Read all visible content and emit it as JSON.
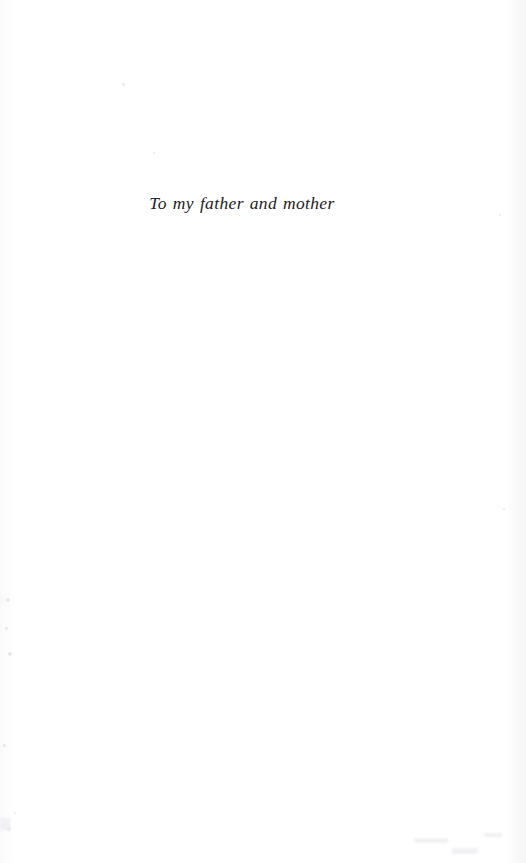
{
  "page": {
    "type": "book-dedication-page",
    "width": 526,
    "height": 863,
    "background_color": "#ffffff",
    "ink_color": "#1c1a1a",
    "artifact_color": "#f2f2f5"
  },
  "dedication": {
    "text": "To my father and mother",
    "style": "italic-serif",
    "alignment": "center",
    "position_px": {
      "left": 168,
      "top": 197,
      "right": 320,
      "baseline": 210
    }
  },
  "scan_artifacts": {
    "right_edge_band": "faint grey vertical band at right page edge",
    "left_edge_band": "faint grey vertical speckle band at left page edge",
    "specks": [
      {
        "x": 122,
        "y": 83,
        "size": 3
      },
      {
        "x": 153,
        "y": 152,
        "size": 2
      },
      {
        "x": 6,
        "y": 598,
        "size": 4
      },
      {
        "x": 5,
        "y": 627,
        "size": 3
      },
      {
        "x": 8,
        "y": 652,
        "size": 4
      },
      {
        "x": 3,
        "y": 744,
        "size": 3
      },
      {
        "x": 6,
        "y": 826,
        "size": 5
      },
      {
        "x": 14,
        "y": 812,
        "size": 2
      },
      {
        "x": 499,
        "y": 214,
        "size": 2
      },
      {
        "x": 503,
        "y": 508,
        "size": 2
      }
    ],
    "smudges": [
      {
        "x": 414,
        "y": 838,
        "width": 34,
        "height": 5
      },
      {
        "x": 452,
        "y": 848,
        "width": 26,
        "height": 6
      },
      {
        "x": 484,
        "y": 833,
        "width": 18,
        "height": 4
      },
      {
        "x": 0,
        "y": 818,
        "width": 10,
        "height": 12
      }
    ]
  }
}
